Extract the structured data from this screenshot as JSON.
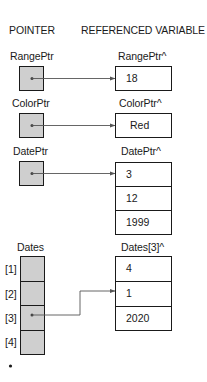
{
  "headers": {
    "pointer": "POINTER",
    "referenced": "REFERENCED VARIABLE"
  },
  "pointers": [
    {
      "name": "RangePtr",
      "target_label": "RangePtr^",
      "target_values": [
        "18"
      ]
    },
    {
      "name": "ColorPtr",
      "target_label": "ColorPtr^",
      "target_values": [
        "Red"
      ]
    },
    {
      "name": "DatePtr",
      "target_label": "DatePtr^",
      "target_values": [
        "3",
        "12",
        "1999"
      ]
    }
  ],
  "array": {
    "name": "Dates",
    "indices": [
      "[1]",
      "[2]",
      "[3]",
      "[4]"
    ],
    "pointing_index": "[3]",
    "target_label": "Dates[3]^",
    "target_values": [
      "4",
      "1",
      "2020"
    ]
  },
  "colors": {
    "pointer_fill": "#cfcfcf",
    "stroke": "#1a1a1a",
    "arrow": "#555555"
  }
}
